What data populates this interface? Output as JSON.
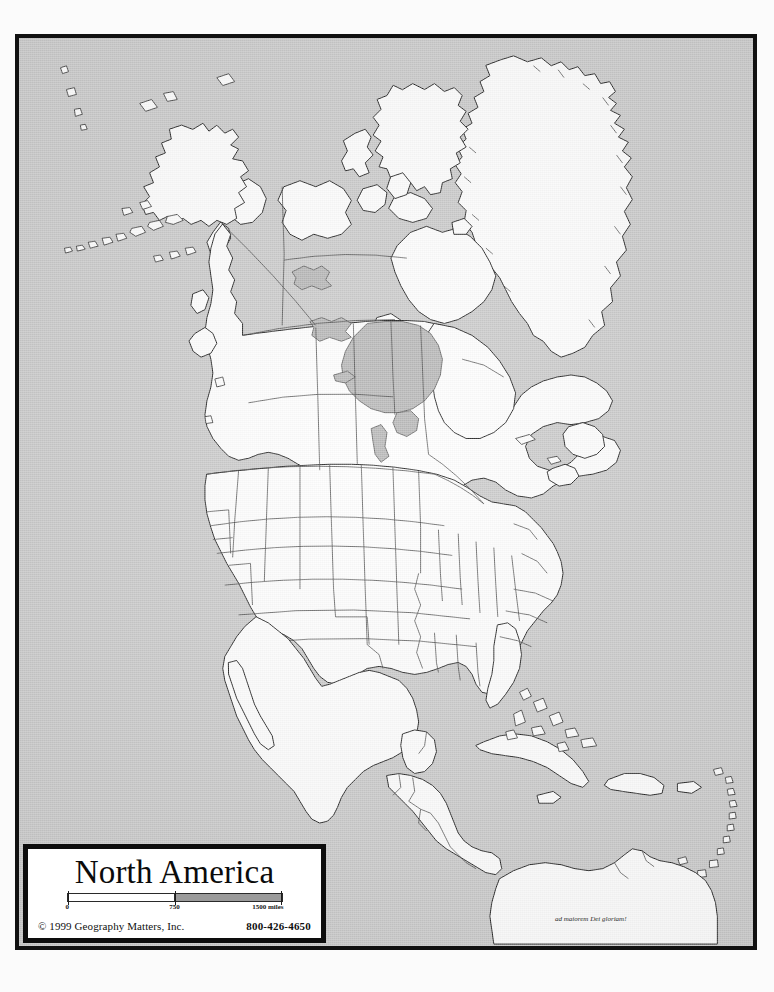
{
  "document": {
    "kind": "printed outline map",
    "background_color": "#c9c9c9",
    "frame_color": "#111111",
    "land_color": "#ffffff",
    "water_color": "#b3b3b3"
  },
  "cartouche": {
    "title": "North America",
    "copyright": "© 1999 Geography Matters, Inc.",
    "phone": "800-426-4650"
  },
  "scale": {
    "unit_label": "1500 miles",
    "ticks": [
      "0",
      "750",
      "1500 miles"
    ],
    "segments": [
      {
        "from": "0",
        "to": "750",
        "fill": "#ffffff"
      },
      {
        "from": "750",
        "to": "1500",
        "fill": "#9a9a9a"
      }
    ]
  },
  "motto": {
    "text": "ad maiorem Dei gloriam!"
  },
  "map_content": {
    "projection_hint": "conic, curved parallels across Canada and the United States",
    "landmasses": [
      "Alaska",
      "Aleutian Islands",
      "Canada mainland",
      "Greenland",
      "Baffin Island",
      "Ellesmere Island",
      "Victoria Island",
      "Banks Island",
      "Newfoundland",
      "Nova Scotia",
      "Vancouver Island",
      "United States (contiguous)",
      "Mexico",
      "Baja California",
      "Yucatan Peninsula",
      "Guatemala",
      "Belize",
      "Honduras",
      "El Salvador",
      "Nicaragua",
      "Costa Rica",
      "Panama",
      "Cuba",
      "Hispaniola",
      "Jamaica",
      "Puerto Rico",
      "Bahamas",
      "Lesser Antilles",
      "northern South America"
    ],
    "water_bodies": [
      "Hudson Bay",
      "Great Bear Lake",
      "Great Slave Lake",
      "Lake Winnipeg",
      "Lake Superior",
      "Lake Michigan",
      "Lake Huron",
      "Lake Erie",
      "Lake Ontario"
    ],
    "internal_boundaries": [
      "United States state lines",
      "Canadian provincial and territorial lines",
      "Central American national lines"
    ]
  }
}
